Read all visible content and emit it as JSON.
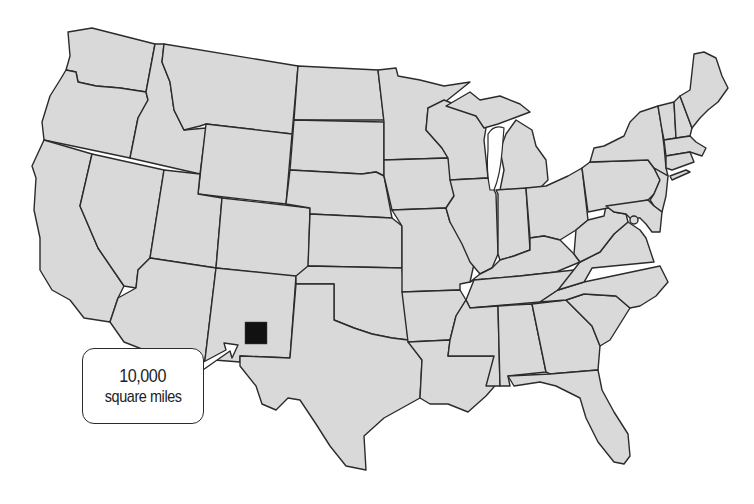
{
  "map": {
    "subject": "Contiguous United States",
    "fill_color": "#d9d9d9",
    "border_color": "#2b2b2b",
    "background_color": "#ffffff"
  },
  "marker": {
    "shape": "square",
    "color": "#111111",
    "location": "southern New Mexico"
  },
  "callout": {
    "value": "10,000",
    "unit": "square miles"
  }
}
